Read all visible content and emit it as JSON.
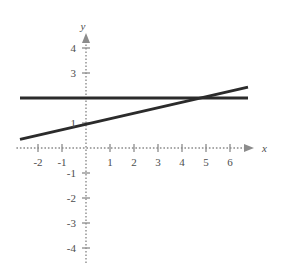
{
  "figure": {
    "background_color": "#ffffff",
    "axis_color": "#8c8c8c",
    "curve_color": "#2b2b2b",
    "label_color": "#4d4d4d"
  },
  "chart_data": {
    "type": "line",
    "title": "",
    "xlabel": "x",
    "ylabel": "y",
    "xlim": [
      -2.9,
      7.0
    ],
    "ylim": [
      -4.6,
      4.6
    ],
    "grid": false,
    "axes_style": "dotted-cross-with-arrows",
    "origin_px": {
      "x": 86,
      "y": 148
    },
    "scale_px_per_unit": {
      "x": 24,
      "y": 25
    },
    "xticks": [
      -2,
      -1,
      0,
      1,
      2,
      3,
      4,
      5,
      6
    ],
    "xtick_labels": [
      "-2",
      "-1",
      "",
      "1",
      "2",
      "3",
      "4",
      "5",
      "6"
    ],
    "yticks": [
      -4,
      -3,
      -2,
      -1,
      0,
      1,
      2,
      3,
      4
    ],
    "ytick_labels": [
      "-4",
      "-3",
      "-2",
      "-1",
      "",
      "1",
      "",
      "3",
      "4"
    ],
    "series": [
      {
        "name": "horizontal-line",
        "equation": "y = 2",
        "slope": 0,
        "intercept": 2,
        "x_start": -2.75,
        "x_end": 6.75,
        "y_start": 2,
        "y_end": 2,
        "color": "#2b2b2b",
        "width": 3
      },
      {
        "name": "slanted-line",
        "equation": "y = 0.22x + 0.95",
        "slope": 0.22,
        "intercept": 0.95,
        "x_start": -2.75,
        "x_end": 6.75,
        "y_start": 0.345,
        "y_end": 2.435,
        "color": "#2b2b2b",
        "width": 3
      }
    ],
    "intersection": {
      "x": 4.77,
      "y": 2
    },
    "legend": []
  }
}
